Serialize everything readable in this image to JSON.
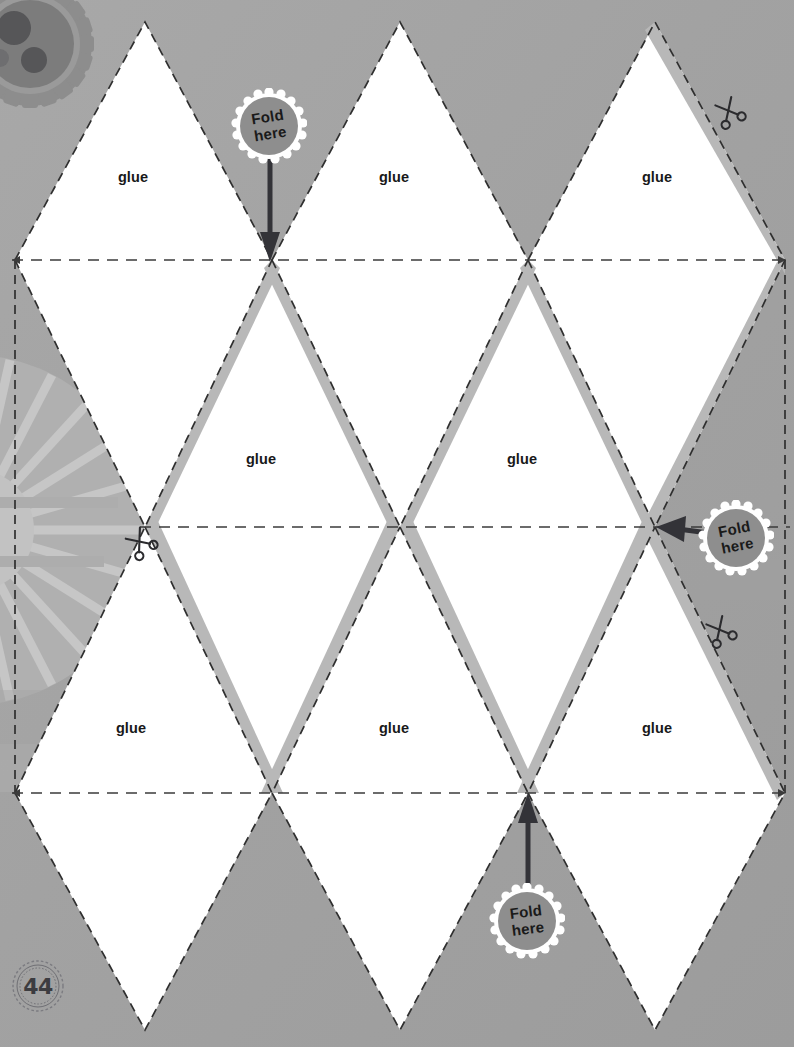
{
  "page": {
    "number": "44",
    "stamp_name": "page-number-stamp",
    "background_color": "#a3a3a3",
    "panel_color": "#ffffff",
    "tab_color": "#b6b6b6",
    "line_color": "#3a3a3a",
    "badge_color": "#8e8e8e",
    "arrow_color": "#333338",
    "width": 794,
    "height": 1047
  },
  "labels": {
    "glue": "glue",
    "fold_line1": "Fold",
    "fold_line2": "here"
  },
  "glue_panels": [
    {
      "id": "glue-r1c1",
      "text": "glue",
      "x": 133,
      "y": 177
    },
    {
      "id": "glue-r1c2",
      "text": "glue",
      "x": 394,
      "y": 177
    },
    {
      "id": "glue-r1c3",
      "text": "glue",
      "x": 657,
      "y": 177
    },
    {
      "id": "glue-r2c1",
      "text": "glue",
      "x": 261,
      "y": 459
    },
    {
      "id": "glue-r2c2",
      "text": "glue",
      "x": 522,
      "y": 459
    },
    {
      "id": "glue-r3c1",
      "text": "glue",
      "x": 131,
      "y": 728
    },
    {
      "id": "glue-r3c2",
      "text": "glue",
      "x": 394,
      "y": 728
    },
    {
      "id": "glue-r3c3",
      "text": "glue",
      "x": 657,
      "y": 728
    }
  ],
  "fold_badges": [
    {
      "id": "fold-badge-top",
      "line1": "Fold",
      "line2": "here",
      "arrow": {
        "x1": 270,
        "y1": 146,
        "x2": 271,
        "y2": 258
      }
    },
    {
      "id": "fold-badge-right",
      "line1": "Fold",
      "line2": "here",
      "arrow": {
        "x1": 712,
        "y1": 533,
        "x2": 658,
        "y2": 527
      }
    },
    {
      "id": "fold-badge-bottom",
      "line1": "Fold",
      "line2": "here",
      "arrow": {
        "x1": 528,
        "y1": 900,
        "x2": 528,
        "y2": 795
      }
    }
  ],
  "scissors": [
    {
      "id": "scissors-top-right",
      "x": 728,
      "y": 110,
      "rotate": -30
    },
    {
      "id": "scissors-mid-left",
      "x": 139,
      "y": 540,
      "rotate": -40
    },
    {
      "id": "scissors-mid-right",
      "x": 719,
      "y": 629,
      "rotate": -30
    }
  ],
  "decorations": [
    {
      "id": "gear-decoration",
      "position": "top-left"
    },
    {
      "id": "ferris-wheel-decoration",
      "position": "left-middle"
    }
  ],
  "geometry": {
    "fold_lines_y": [
      260,
      527,
      793
    ],
    "top_tips_y": 22,
    "bottom_tips_y": 1030,
    "row1_vertices_x": [
      15,
      272,
      528,
      785
    ],
    "row2_vertices_x": [
      145,
      400,
      655
    ],
    "column_count": 3,
    "row_count": 3
  }
}
